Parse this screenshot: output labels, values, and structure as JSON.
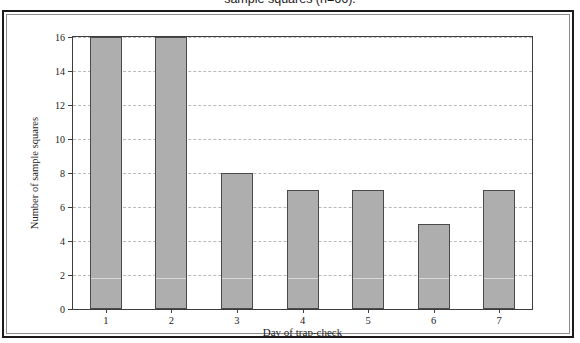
{
  "caption": {
    "text": "sample squares (n=66)."
  },
  "chart_data": {
    "type": "bar",
    "title": "",
    "categories": [
      "1",
      "2",
      "3",
      "4",
      "5",
      "6",
      "7"
    ],
    "values": [
      16,
      16,
      8,
      7,
      7,
      5,
      7
    ],
    "xlabel": "Day of trap-check",
    "ylabel": "Number of sample squares",
    "ylim": [
      0,
      16
    ],
    "yticks": [
      0,
      2,
      4,
      6,
      8,
      10,
      12,
      14,
      16
    ],
    "ytick_labels": [
      "0",
      "2",
      "4",
      "6",
      "8",
      "10",
      "12",
      "14",
      "16"
    ],
    "grid": true,
    "legend": false,
    "bar_fill_color": "#aeaeae",
    "bar_edge_color": "#4a4a4a",
    "gridline_color": "#b9b9b9",
    "axis_color": "#3d3d3d",
    "frame_color": "#1b1b1b"
  }
}
